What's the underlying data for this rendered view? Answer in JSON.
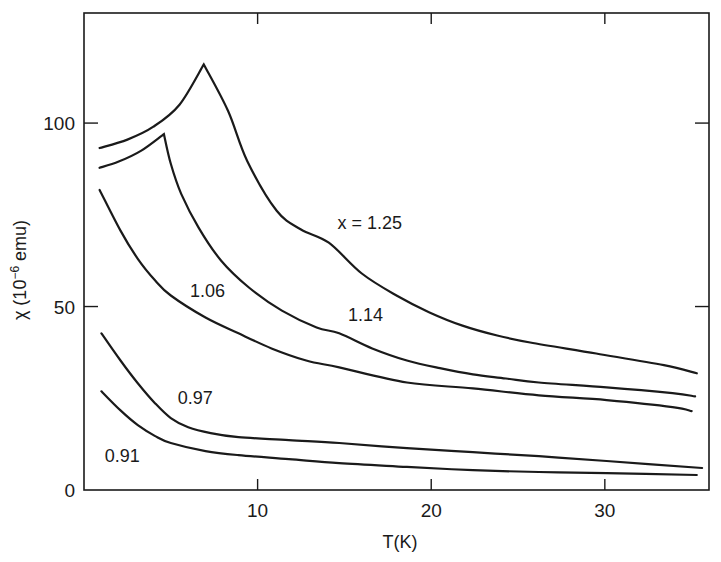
{
  "chart_data": {
    "type": "line",
    "title": "",
    "xlabel": "T(K)",
    "ylabel_main": "χ (10",
    "ylabel_exp": "−6",
    "ylabel_unit": " emu)",
    "xlim": [
      0,
      36
    ],
    "ylim": [
      0,
      130
    ],
    "xticks": [
      10,
      20,
      30
    ],
    "xtick_labels": [
      "10",
      "20",
      "30"
    ],
    "yticks": [
      0,
      50,
      100
    ],
    "ytick_labels": [
      "0",
      "50",
      "100"
    ],
    "grid": false,
    "legend": "none (curves labelled inline)",
    "series": [
      {
        "name": "x = 1.25",
        "label": "x = 1.25",
        "label_at": [
          14.6,
          71
        ],
        "points": [
          [
            0.9,
            93.2
          ],
          [
            2.5,
            95.5
          ],
          [
            4.0,
            99.0
          ],
          [
            5.5,
            105.0
          ],
          [
            6.9,
            116.0
          ],
          [
            8.3,
            103.3
          ],
          [
            9.4,
            89.7
          ],
          [
            11.1,
            76.1
          ],
          [
            12.5,
            71.0
          ],
          [
            14.1,
            67.4
          ],
          [
            16.0,
            59.0
          ],
          [
            18.0,
            53.0
          ],
          [
            19.9,
            48.4
          ],
          [
            21.8,
            44.8
          ],
          [
            23.8,
            42.1
          ],
          [
            25.7,
            40.2
          ],
          [
            29.5,
            37.2
          ],
          [
            33.4,
            34.0
          ],
          [
            35.3,
            31.8
          ]
        ]
      },
      {
        "name": "1.14",
        "label": "1.14",
        "label_at": [
          15.2,
          46
        ],
        "points": [
          [
            0.9,
            87.8
          ],
          [
            2.0,
            89.5
          ],
          [
            3.3,
            92.5
          ],
          [
            4.6,
            97.0
          ],
          [
            5.0,
            88.9
          ],
          [
            5.6,
            80.7
          ],
          [
            6.6,
            71.5
          ],
          [
            7.9,
            62.5
          ],
          [
            9.5,
            55.2
          ],
          [
            11.4,
            48.9
          ],
          [
            13.4,
            44.3
          ],
          [
            14.7,
            42.7
          ],
          [
            16.6,
            38.6
          ],
          [
            18.6,
            35.3
          ],
          [
            20.5,
            33.2
          ],
          [
            22.4,
            31.5
          ],
          [
            24.3,
            30.4
          ],
          [
            26.2,
            29.3
          ],
          [
            30.1,
            28.0
          ],
          [
            33.9,
            26.4
          ],
          [
            35.2,
            25.5
          ]
        ]
      },
      {
        "name": "1.06",
        "label": "1.06",
        "label_at": [
          6.1,
          52.5
        ],
        "points": [
          [
            0.9,
            81.8
          ],
          [
            2.1,
            70.7
          ],
          [
            3.1,
            63.0
          ],
          [
            4.1,
            57.1
          ],
          [
            5.0,
            53.0
          ],
          [
            7.0,
            47.0
          ],
          [
            8.9,
            42.7
          ],
          [
            10.8,
            38.6
          ],
          [
            12.8,
            35.3
          ],
          [
            14.7,
            33.4
          ],
          [
            18.6,
            29.3
          ],
          [
            22.4,
            27.7
          ],
          [
            26.2,
            25.8
          ],
          [
            30.1,
            24.5
          ],
          [
            33.9,
            22.6
          ],
          [
            35.0,
            21.5
          ]
        ]
      },
      {
        "name": "0.97",
        "label": "0.97",
        "label_at": [
          5.4,
          23.5
        ],
        "points": [
          [
            1.0,
            42.7
          ],
          [
            2.1,
            35.3
          ],
          [
            3.1,
            29.1
          ],
          [
            4.1,
            23.6
          ],
          [
            5.0,
            19.6
          ],
          [
            6.0,
            17.1
          ],
          [
            7.3,
            15.5
          ],
          [
            8.9,
            14.4
          ],
          [
            11.8,
            13.6
          ],
          [
            14.7,
            12.8
          ],
          [
            18.6,
            11.4
          ],
          [
            22.4,
            10.3
          ],
          [
            26.2,
            9.2
          ],
          [
            30.1,
            7.9
          ],
          [
            35.6,
            6.0
          ]
        ]
      },
      {
        "name": "0.91",
        "label": "0.91",
        "label_at": [
          1.2,
          7.5
        ],
        "points": [
          [
            1.0,
            26.9
          ],
          [
            2.1,
            21.7
          ],
          [
            3.1,
            17.7
          ],
          [
            4.1,
            14.7
          ],
          [
            5.0,
            12.8
          ],
          [
            7.0,
            10.6
          ],
          [
            8.9,
            9.5
          ],
          [
            11.8,
            8.4
          ],
          [
            14.7,
            7.3
          ],
          [
            18.6,
            6.3
          ],
          [
            22.4,
            5.4
          ],
          [
            26.2,
            4.9
          ],
          [
            30.1,
            4.6
          ],
          [
            35.3,
            4.1
          ]
        ]
      }
    ]
  }
}
